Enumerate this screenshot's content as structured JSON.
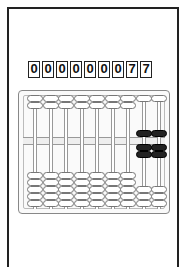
{
  "display": {
    "digits": [
      "0",
      "0",
      "0",
      "0",
      "0",
      "0",
      "0",
      "7",
      "7"
    ],
    "value": "000000077"
  },
  "abacus": {
    "columns": 9,
    "upper_beads_per_rod": 2,
    "lower_beads_per_rod": 5,
    "column_values": [
      0,
      0,
      0,
      0,
      0,
      0,
      0,
      7,
      7
    ],
    "colors": {
      "active_bead": "#222222",
      "inactive_bead": "#ffffff",
      "frame": "#888888"
    }
  }
}
